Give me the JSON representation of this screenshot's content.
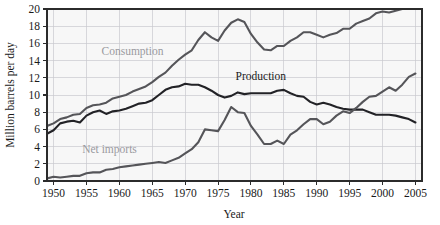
{
  "chart_data": {
    "type": "line",
    "title": "",
    "xlabel": "Year",
    "ylabel": "Million barrels per day",
    "xlim": [
      1949,
      2006
    ],
    "ylim": [
      0,
      20
    ],
    "ytick_labels": [
      "0",
      "2",
      "4",
      "6",
      "8",
      "10",
      "12",
      "14",
      "16",
      "18",
      "20"
    ],
    "ytick_values": [
      0,
      2,
      4,
      6,
      8,
      10,
      12,
      14,
      16,
      18,
      20
    ],
    "xtick_labels": [
      "1950",
      "1955",
      "1960",
      "1965",
      "1970",
      "1975",
      "1980",
      "1985",
      "1990",
      "1995",
      "2000",
      "2005"
    ],
    "xtick_values": [
      1950,
      1955,
      1960,
      1965,
      1970,
      1975,
      1980,
      1985,
      1990,
      1995,
      2000,
      2005
    ],
    "grid": true,
    "legend_position": "inline-annotations",
    "x": [
      1949,
      1950,
      1951,
      1952,
      1953,
      1954,
      1955,
      1956,
      1957,
      1958,
      1959,
      1960,
      1961,
      1962,
      1963,
      1964,
      1965,
      1966,
      1967,
      1968,
      1969,
      1970,
      1971,
      1972,
      1973,
      1974,
      1975,
      1976,
      1977,
      1978,
      1979,
      1980,
      1981,
      1982,
      1983,
      1984,
      1985,
      1986,
      1987,
      1988,
      1989,
      1990,
      1991,
      1992,
      1993,
      1994,
      1995,
      1996,
      1997,
      1998,
      1999,
      2000,
      2001,
      2002,
      2003,
      2004,
      2005
    ],
    "series": [
      {
        "name": "Consumption",
        "color": "#555559",
        "label_color": "#9a9a9f",
        "label_x": 1962.0,
        "label_y": 14.6,
        "values": [
          6.4,
          6.7,
          7.2,
          7.4,
          7.7,
          7.8,
          8.5,
          8.8,
          8.9,
          9.1,
          9.6,
          9.8,
          10.0,
          10.4,
          10.7,
          11.0,
          11.5,
          12.1,
          12.6,
          13.4,
          14.1,
          14.7,
          15.2,
          16.4,
          17.3,
          16.7,
          16.3,
          17.5,
          18.4,
          18.8,
          18.5,
          17.1,
          16.1,
          15.3,
          15.2,
          15.7,
          15.7,
          16.3,
          16.7,
          17.3,
          17.3,
          17.0,
          16.7,
          17.0,
          17.2,
          17.7,
          17.7,
          18.3,
          18.6,
          18.9,
          19.5,
          19.7,
          19.6,
          19.8,
          20.0,
          20.7,
          20.8
        ]
      },
      {
        "name": "Production",
        "color": "#222226",
        "label_color": "#1a1a1a",
        "label_x": 1981.5,
        "label_y": 11.7,
        "values": [
          5.5,
          5.9,
          6.7,
          6.9,
          7.0,
          6.8,
          7.6,
          8.0,
          8.2,
          7.8,
          8.1,
          8.2,
          8.4,
          8.7,
          9.0,
          9.1,
          9.4,
          10.0,
          10.6,
          10.9,
          11.0,
          11.3,
          11.2,
          11.2,
          10.9,
          10.5,
          10.0,
          9.7,
          9.9,
          10.3,
          10.1,
          10.2,
          10.2,
          10.2,
          10.2,
          10.5,
          10.6,
          10.2,
          9.9,
          9.8,
          9.2,
          8.9,
          9.1,
          8.9,
          8.6,
          8.4,
          8.3,
          8.3,
          8.3,
          8.0,
          7.7,
          7.7,
          7.7,
          7.6,
          7.4,
          7.2,
          6.8
        ]
      },
      {
        "name": "Net imports",
        "color": "#555559",
        "label_color": "#9a9a9f",
        "label_x": 1958.5,
        "label_y": 3.2,
        "values": [
          0.3,
          0.5,
          0.4,
          0.5,
          0.6,
          0.6,
          0.9,
          1.0,
          1.0,
          1.3,
          1.4,
          1.6,
          1.7,
          1.8,
          1.9,
          2.0,
          2.1,
          2.2,
          2.1,
          2.4,
          2.7,
          3.2,
          3.7,
          4.5,
          6.0,
          5.9,
          5.8,
          7.1,
          8.6,
          8.0,
          7.9,
          6.4,
          5.4,
          4.3,
          4.3,
          4.7,
          4.3,
          5.4,
          5.9,
          6.6,
          7.2,
          7.2,
          6.6,
          6.9,
          7.6,
          8.1,
          7.9,
          8.5,
          9.2,
          9.8,
          9.9,
          10.4,
          10.9,
          10.5,
          11.2,
          12.1,
          12.5
        ]
      }
    ]
  },
  "axes": {
    "y_title": "Million barrels per day",
    "x_title": "Year"
  }
}
